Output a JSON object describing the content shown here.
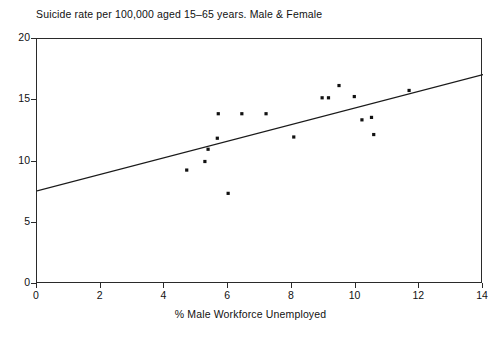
{
  "chart_data": {
    "type": "scatter",
    "title": "Suicide rate per 100,000 aged 15–65 years. Male & Female",
    "xlabel": "% Male Workforce Unemployed",
    "ylabel": "",
    "xlim": [
      0,
      14
    ],
    "ylim": [
      0,
      20
    ],
    "xticks": [
      "0",
      "2",
      "4",
      "6",
      "8",
      "10",
      "12",
      "14"
    ],
    "xtick_values": [
      0,
      2,
      4,
      6,
      8,
      10,
      12,
      14
    ],
    "yticks": [
      "0",
      "5",
      "10",
      "15",
      "20"
    ],
    "ytick_values": [
      0,
      5,
      10,
      15,
      20
    ],
    "grid": false,
    "legend": null,
    "marker_color": "#111111",
    "line_color": "#1a1a1a",
    "axis_color": "#2a2a2a",
    "points": [
      {
        "x": 4.7,
        "y": 9.3
      },
      {
        "x": 5.27,
        "y": 10.0
      },
      {
        "x": 5.37,
        "y": 11.0
      },
      {
        "x": 5.66,
        "y": 11.9
      },
      {
        "x": 5.69,
        "y": 13.9
      },
      {
        "x": 6.0,
        "y": 7.4
      },
      {
        "x": 6.43,
        "y": 13.9
      },
      {
        "x": 7.19,
        "y": 13.9
      },
      {
        "x": 8.06,
        "y": 12.0
      },
      {
        "x": 8.95,
        "y": 15.2
      },
      {
        "x": 9.15,
        "y": 15.2
      },
      {
        "x": 9.48,
        "y": 16.2
      },
      {
        "x": 9.96,
        "y": 15.3
      },
      {
        "x": 10.2,
        "y": 13.4
      },
      {
        "x": 10.5,
        "y": 13.6
      },
      {
        "x": 10.57,
        "y": 12.2
      },
      {
        "x": 11.68,
        "y": 15.8
      }
    ],
    "trendline": {
      "x0": 0.0,
      "y0": 7.6,
      "x1": 14.0,
      "y1": 17.1
    }
  }
}
